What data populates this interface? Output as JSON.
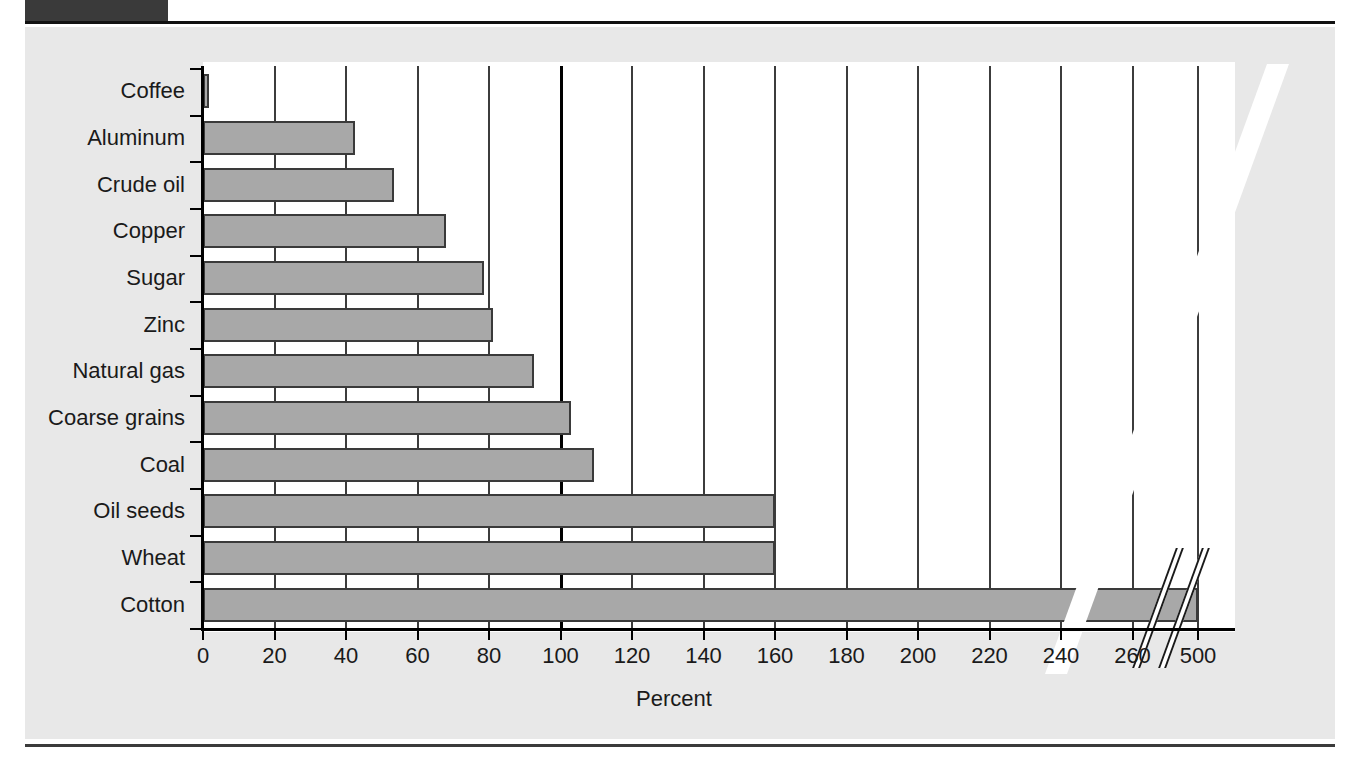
{
  "page": {
    "background_color": "#ffffff",
    "panel_color": "#e8e8e8",
    "header_block_color": "#3a3a3a",
    "rule_color": "#111111"
  },
  "chart_data": {
    "type": "bar",
    "orientation": "horizontal",
    "title": "",
    "subtitle": "",
    "xlabel": "Percent",
    "ylabel": "",
    "categories": [
      "Coffee",
      "Aluminum",
      "Crude oil",
      "Copper",
      "Sugar",
      "Zinc",
      "Natural gas",
      "Coarse grains",
      "Coal",
      "Oil seeds",
      "Wheat",
      "Cotton"
    ],
    "values": [
      1.5,
      42.5,
      53.5,
      68,
      78.5,
      81,
      92.5,
      103,
      109.5,
      160,
      160,
      500
    ],
    "xlim": [
      0,
      280
    ],
    "xticks": [
      0,
      20,
      40,
      60,
      80,
      100,
      120,
      140,
      160,
      180,
      200,
      220,
      240,
      260,
      500
    ],
    "xtick_labels": [
      "0",
      "20",
      "40",
      "60",
      "80",
      "100",
      "120",
      "140",
      "160",
      "180",
      "200",
      "220",
      "240",
      "260",
      "500"
    ],
    "grid": true,
    "grid_axis": "x",
    "emphasized_gridline": 100,
    "axis_break": {
      "present": true,
      "between": [
        260,
        500
      ],
      "style": "double-slash"
    },
    "legend": {
      "present": false,
      "position": "none"
    },
    "bar_fill_color": "#a8a8a8",
    "bar_edge_color": "#3a3a3a",
    "plot_background": "#ffffff"
  }
}
